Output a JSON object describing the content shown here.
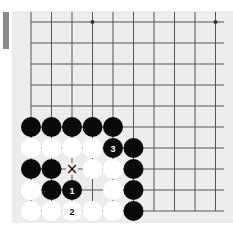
{
  "board": {
    "background": "#ececec",
    "line_color": "#555555",
    "cols_x": [
      31,
      51.5,
      72,
      92.5,
      113,
      133.5,
      154,
      174.5,
      195,
      215.5
    ],
    "rows_y": [
      22,
      43,
      64,
      85,
      106,
      127,
      148,
      169,
      190,
      211
    ],
    "star_points": [
      [
        3,
        0
      ],
      [
        9,
        0
      ]
    ],
    "stones": [
      {
        "col": 0,
        "row": 5,
        "color": "black"
      },
      {
        "col": 1,
        "row": 5,
        "color": "black"
      },
      {
        "col": 2,
        "row": 5,
        "color": "black"
      },
      {
        "col": 3,
        "row": 5,
        "color": "black"
      },
      {
        "col": 4,
        "row": 5,
        "color": "black"
      },
      {
        "col": 0,
        "row": 6,
        "color": "white"
      },
      {
        "col": 1,
        "row": 6,
        "color": "white"
      },
      {
        "col": 2,
        "row": 6,
        "color": "white"
      },
      {
        "col": 3,
        "row": 6,
        "color": "white"
      },
      {
        "col": 4,
        "row": 6,
        "color": "black",
        "label": "3"
      },
      {
        "col": 5,
        "row": 6,
        "color": "black"
      },
      {
        "col": 0,
        "row": 7,
        "color": "black"
      },
      {
        "col": 1,
        "row": 7,
        "color": "black"
      },
      {
        "col": 3,
        "row": 7,
        "color": "white"
      },
      {
        "col": 4,
        "row": 7,
        "color": "white"
      },
      {
        "col": 5,
        "row": 7,
        "color": "black"
      },
      {
        "col": 0,
        "row": 8,
        "color": "white"
      },
      {
        "col": 1,
        "row": 8,
        "color": "black"
      },
      {
        "col": 2,
        "row": 8,
        "color": "black",
        "label": "1"
      },
      {
        "col": 4,
        "row": 8,
        "color": "white"
      },
      {
        "col": 5,
        "row": 8,
        "color": "black"
      },
      {
        "col": 0,
        "row": 9,
        "color": "white"
      },
      {
        "col": 1,
        "row": 9,
        "color": "white"
      },
      {
        "col": 2,
        "row": 9,
        "color": "white",
        "label": "2"
      },
      {
        "col": 3,
        "row": 9,
        "color": "white"
      },
      {
        "col": 4,
        "row": 9,
        "color": "white"
      },
      {
        "col": 5,
        "row": 9,
        "color": "black"
      }
    ],
    "markers": [
      {
        "col": 2,
        "row": 7,
        "symbol": "×"
      }
    ]
  }
}
